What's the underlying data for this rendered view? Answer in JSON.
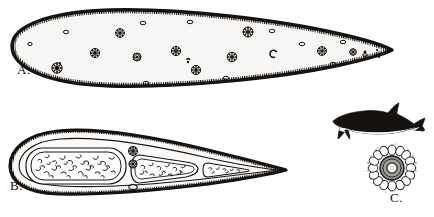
{
  "plate": {
    "type": "scientific-illustration-plate",
    "style": "black-and-white-line-drawing",
    "background_color": "#ffffff",
    "ink_color": "#15120f",
    "width": 434,
    "height": 217,
    "panel_count": 3
  },
  "labels": {
    "a": "A.",
    "b": "B.",
    "c": "C."
  },
  "panels": [
    {
      "id": "a",
      "label": "A.",
      "name": "whole-mount-dorsal-view",
      "description": "Elongate lanceolate body, rounded anterior end at left, sharply pointed posterior tip at right, thick dark marginal outline with fine comb-like ciliated fringe along inner edge, pale interior scattered with rosette and oval inclusions",
      "outline_color": "#15120f",
      "interior_color": "#f7f6f4",
      "fringe": "comb-like-cilia",
      "inclusion_counts": {
        "rosettes": 14,
        "ovals": 12,
        "dots": 5
      }
    },
    {
      "id": "b",
      "label": "B.",
      "name": "internal-anatomy-view",
      "description": "Same body form with tapering tail, showing three nested oval compartments of decreasing size containing granular squiggled contents, a double inner contour line, and two dark rosettes between the first and second compartments",
      "outline_color": "#15120f",
      "interior_color": "#fbfaf9",
      "compartment_count": 3,
      "rosette_cluster_count": 2
    },
    {
      "id": "c",
      "label": "C.",
      "name": "transverse-section-view",
      "description": "Circular transverse section with a central pale lumen, a gray annular ring, and an outer cobblestone layer of polygonal cells surrounded by a stippled fringe",
      "ring_color": "#8f8d8a",
      "lumen_color": "#ffffff",
      "cell_layer_color": "#ffffff",
      "cell_count": 18
    }
  ],
  "inset": {
    "name": "host-dolphin-silhouette",
    "description": "Small lateral silhouette of a dolphin or porpoise, dark dorsal surface with pale ventral counter-shading, dorsal fin, flipper and flukes",
    "dorsal_color": "#15120f",
    "ventral_color": "#ffffff"
  }
}
